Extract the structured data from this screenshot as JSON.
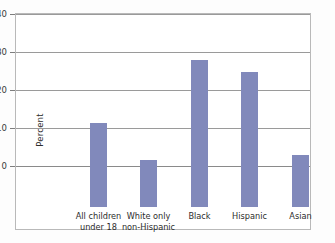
{
  "figure": {
    "border_color": "#b9b9b9",
    "background": "#ffffff"
  },
  "chart_data": {
    "type": "bar",
    "title": "",
    "subtitle": "",
    "xlabel": "",
    "ylabel": "Percent",
    "categories": [
      "All children under 18",
      "White only non-Hispanic",
      "Black",
      "Hispanic",
      "Asian"
    ],
    "category_lines": [
      [
        "All children",
        "under 18"
      ],
      [
        "White only",
        "non-Hispanic"
      ],
      [
        "Black",
        ""
      ],
      [
        "Hispanic",
        ""
      ],
      [
        "Asian",
        ""
      ]
    ],
    "values": [
      22.0,
      12.2,
      38.5,
      35.2,
      13.5
    ],
    "ylim": [
      0,
      40
    ],
    "yticks": [
      0,
      10,
      20,
      30,
      40
    ],
    "ytick_labels": [
      "0",
      "10",
      "20",
      "30",
      "40"
    ],
    "grid": true,
    "grid_axis": "y",
    "legend": false,
    "bar_color": "#8189bb",
    "grid_color": "#9a9a9a"
  }
}
